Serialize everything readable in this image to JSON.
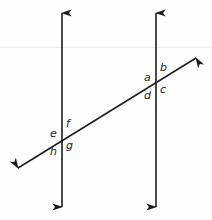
{
  "figure": {
    "background_color": "#fefefe",
    "stroke_color": "#1c1c1c",
    "label_color": "#1c1c1c"
  },
  "lines": {
    "left_parallel": {
      "name": "left vertical line",
      "orientation": "vertical",
      "arrowheads": "both",
      "x": 62,
      "y_top": 13,
      "y_bottom": 207
    },
    "right_parallel": {
      "name": "right vertical line",
      "orientation": "vertical",
      "arrowheads": "both",
      "x": 156,
      "y_top": 13,
      "y_bottom": 207
    },
    "transversal": {
      "name": "transversal line",
      "orientation": "diagonal",
      "arrowheads": "both",
      "x_start": 18,
      "y_start": 168,
      "x_end": 196,
      "y_end": 58
    }
  },
  "intersections": {
    "left": {
      "x": 62,
      "y": 138
    },
    "right": {
      "x": 156,
      "y": 85
    }
  },
  "angle_labels": [
    {
      "id": "a",
      "text": "a",
      "intersection": "right",
      "position": "upper-left"
    },
    {
      "id": "b",
      "text": "b",
      "intersection": "right",
      "position": "upper-right"
    },
    {
      "id": "c",
      "text": "c",
      "intersection": "right",
      "position": "lower-right"
    },
    {
      "id": "d",
      "text": "d",
      "intersection": "right",
      "position": "lower-left"
    },
    {
      "id": "e",
      "text": "e",
      "intersection": "left",
      "position": "upper-left"
    },
    {
      "id": "f",
      "text": "f",
      "intersection": "left",
      "position": "upper-right"
    },
    {
      "id": "g",
      "text": "g",
      "intersection": "left",
      "position": "lower-right"
    },
    {
      "id": "h",
      "text": "h",
      "intersection": "left",
      "position": "lower-left"
    }
  ]
}
